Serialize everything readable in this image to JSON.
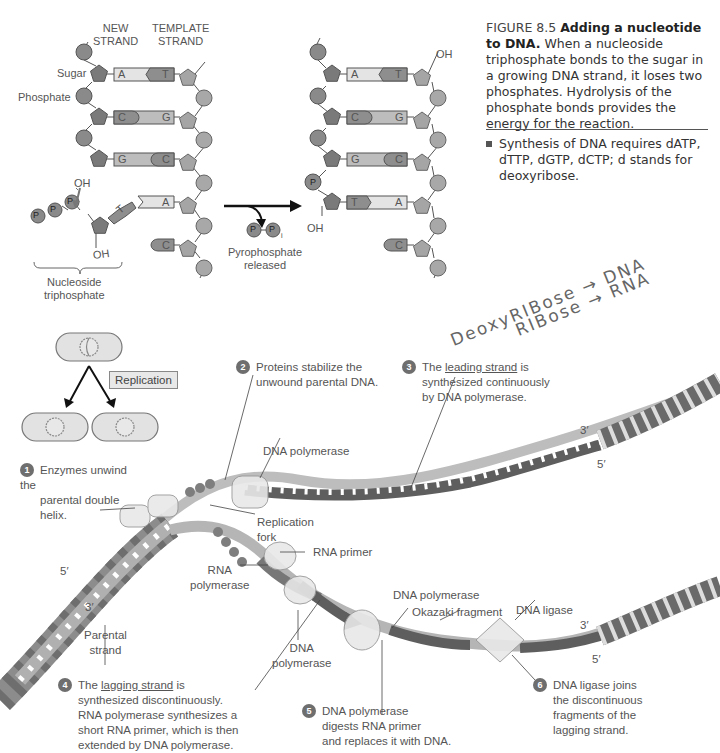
{
  "figure": {
    "number": "FIGURE 8.5",
    "title": "Adding a nucleotide to DNA.",
    "caption": "When a nucleoside triphosphate bonds to the sugar in a growing DNA strand, it loses two phosphates. Hydrolysis of the phosphate bonds provides the energy for the reaction.",
    "bullet": "Synthesis of DNA requires dATP, dTTP, dGTP, dCTP; d stands for deoxyribose."
  },
  "nucleotide_diagram": {
    "new_strand_label": [
      "NEW",
      "STRAND"
    ],
    "template_strand_label": [
      "TEMPLATE",
      "STRAND"
    ],
    "sugar_label": "Sugar",
    "phosphate_label": "Phosphate",
    "oh_label": "OH",
    "left_pairs": [
      {
        "new": "A",
        "template": "T"
      },
      {
        "new": "C",
        "template": "G"
      },
      {
        "new": "G",
        "template": "C"
      },
      {
        "new": "T",
        "template": "A"
      },
      {
        "new": "",
        "template": "C"
      }
    ],
    "right_pairs": [
      {
        "new": "A",
        "template": "T"
      },
      {
        "new": "C",
        "template": "G"
      },
      {
        "new": "G",
        "template": "C"
      },
      {
        "new": "T",
        "template": "A"
      },
      {
        "new": "",
        "template": "C"
      }
    ],
    "phosphate_symbol": "P",
    "nucleoside_triphosphate_label": [
      "Nucleoside",
      "triphosphate"
    ],
    "pyrophosphate_label": [
      "Pyrophosphate",
      "released"
    ],
    "pi_subscript": "i"
  },
  "handwritten_note": {
    "line1": "DeoxyRIBose → DNA",
    "line2": "RIBose → RNA"
  },
  "replication": {
    "box_label": "Replication"
  },
  "fork_diagram": {
    "labels": {
      "dna_polymerase_top": "DNA polymerase",
      "replication_fork": [
        "Replication",
        "fork"
      ],
      "rna_primer": "RNA primer",
      "rna_polymerase": [
        "RNA",
        "polymerase"
      ],
      "dna_polymerase_mid": [
        "DNA",
        "polymerase"
      ],
      "dna_polymerase_right": "DNA polymerase",
      "okazaki_fragment": "Okazaki fragment",
      "dna_ligase": "DNA ligase",
      "parental_strand": [
        "Parental",
        "strand"
      ],
      "five_prime": "5′",
      "three_prime": "3′"
    },
    "steps": [
      {
        "n": "1",
        "lines": [
          "Enzymes unwind the",
          "parental double",
          "helix."
        ]
      },
      {
        "n": "2",
        "lines": [
          "Proteins stabilize the",
          "unwound parental DNA."
        ]
      },
      {
        "n": "3",
        "pre": "The ",
        "u": "leading strand",
        "post": " is",
        "lines": [
          "synthesized continuously",
          "by DNA polymerase."
        ]
      },
      {
        "n": "4",
        "pre": "The ",
        "u": "lagging strand",
        "post": " is",
        "lines": [
          "synthesized discontinuously.",
          "RNA polymerase synthesizes a",
          "short RNA primer, which is then",
          "extended by DNA polymerase."
        ]
      },
      {
        "n": "5",
        "lines": [
          "DNA polymerase",
          "digests RNA primer",
          "and replaces it with DNA."
        ]
      },
      {
        "n": "6",
        "lines": [
          "DNA ligase joins",
          "the discontinuous",
          "fragments of the",
          "lagging strand."
        ]
      }
    ]
  },
  "colors": {
    "dark_gray": "#6b6b6b",
    "mid_gray": "#9a9a9a",
    "light_gray": "#cfcfcf",
    "pale": "#e6e6e6",
    "text": "#444444"
  }
}
